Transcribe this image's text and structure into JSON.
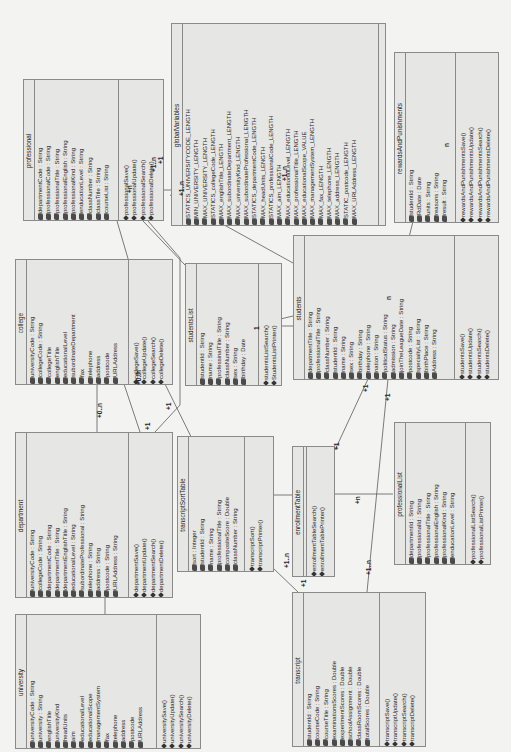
{
  "diagram": {
    "type": "UML class diagram",
    "orientation": "rotated -90deg",
    "colors": {
      "background": "#f3f3f1",
      "box_fill": "#e6e6e4",
      "border": "#8a8a8a",
      "line": "#555555",
      "text": "#222222"
    }
  },
  "classes": {
    "professional": {
      "name": "professional",
      "attributes": [
        "departmentCode : String",
        "professionalCode : String",
        "professionalTitle : String",
        "professionalEnglish : String",
        "professionalKind : String",
        "enducationLevel : String",
        "classNumber : String",
        "classTitle : String",
        "courseList : String"
      ],
      "methods": [
        "professionalSave()",
        "professionalUpdate()",
        "professionalSearch()",
        "professionalDelete()"
      ]
    },
    "globalVariables": {
      "name": "globalVariables",
      "attributes": [
        "STATICS_UNIVERSITYCODE_LENGTH",
        "MIN_UNIVERSITY_LENGTH",
        "MAX_UNIVERSITY_LENGTH",
        "STATICS_collegeCode_LENGTH",
        "MAX_englishTitle_LENGTH",
        "MAX_subordinateDepartment_LENGTH",
        "MAX_universityKind_LENGTH",
        "MAX_subordinateProfessional_LENGTH",
        "STATICS_departmentCode_LENGTH",
        "MAX_headUnits_LENGTH",
        "STATICS_professionalCode_LENGTH",
        "MAX_aim_LENGTH",
        "MAX_educationalLevel_LENGTH",
        "MAX_professionalTitle_LENGTH",
        "MAX_educationalScope_VALUE",
        "MAX_managementSystem_LENGTH",
        "MAX_fax_LENGTH",
        "MAX_telephone_LENGTH",
        "MAX_address_LENGTH",
        "STATIC_postcode_LENGTH",
        "MAX_URLAddress_LENGTH"
      ],
      "methods": []
    },
    "rewardsAndPunishments": {
      "name": "rewardsAndPunishments",
      "attributes": [
        "studentId : String",
        "RdDate : Date",
        "units : String",
        "reasons : String",
        "result : String"
      ],
      "methods": [
        "rewardsAndPunishmentsSave()",
        "rewardsAndPunishmentsUpdate()",
        "rewardsAndPunishmentsSearch()",
        "rewardsAndPunishmentsDelete()"
      ]
    },
    "college": {
      "name": "college",
      "attributes": [
        "universityCode : String",
        "collegeCode : String",
        "collegeTitle",
        "englishTitle",
        "educationalLevel",
        "subordinateDepartment",
        "fax",
        "telephone",
        "address",
        "postcode",
        "URLAddress"
      ],
      "methods": [
        "collegeSave()",
        "collegeUpdate()",
        "collegeSearch()",
        "collegeDelete()"
      ]
    },
    "studentsList": {
      "name": "studentsList",
      "attributes": [
        "studentId : String",
        "name : String",
        "professinalTitle : String",
        "classNumber : String",
        "sex : String",
        "birthday : Date"
      ],
      "methods": [
        "studentsListSearch()",
        "StudentsListPrinter()"
      ]
    },
    "students": {
      "name": "students",
      "attributes": [
        "depatmentTitle : String",
        "professionalTitle : String",
        "classNumber : String",
        "studentId : String",
        "name : String",
        "sex : String",
        "birthday : String",
        "telephone : String",
        "nation : String",
        "politicalStatus : String",
        "admission : String",
        "joinTheLeagueDate : String",
        "postcode : String",
        "specialtyList : String",
        "birthPlace : String",
        "Address : String"
      ],
      "methods": [
        "studentsSave()",
        "studentsUpdate()",
        "studentsSearch()",
        "studentsDelete()"
      ]
    },
    "department": {
      "name": "department",
      "attributes": [
        "universityCode : String",
        "collegeCode : String",
        "departmentCode : String",
        "departmentTitle : String",
        "departmentEnglishTitle : String",
        "educationalLevel : String",
        "subordinateProfessional : String",
        "telephone : String",
        "address : String",
        "postcode : String",
        "URLAddress : String"
      ],
      "methods": [
        "departmentSave()",
        "departmentUpdate()",
        "departmentSearch()",
        "departmentDelete()"
      ]
    },
    "transcriptSortTable": {
      "name": "transcriptSortTable",
      "attributes": [
        "sort : Integer",
        "studentId : String",
        "name : String",
        "professionalTitle : String",
        "compositeScore : Double",
        "classNumber : String"
      ],
      "methods": [
        "transcriptSort()",
        "transcriptPrinter()"
      ]
    },
    "enrollmentTable": {
      "name": "enrollmentTable",
      "attributes": [],
      "methods": [
        "enrollmentTableSearch()",
        "enrollmentTablePrinter()"
      ]
    },
    "professionalList": {
      "name": "professionalList",
      "attributes": [
        "departmentId : String",
        "professionalId : String",
        "professionalTitle : String",
        "professionalEnglish : String",
        "professionalKind : String",
        "enducationLevel : String"
      ],
      "methods": [
        "professionalListSearch()",
        "professionalListPrinter()"
      ]
    },
    "university": {
      "name": "university",
      "attributes": [
        "universityCode : String",
        "university : String",
        "englishTitle",
        "universityKind",
        "headUnits",
        "aim",
        "educationalLevel",
        "educationalScope",
        "managementSystem",
        "fax",
        "telephone",
        "address",
        "postcode",
        "URLAddress"
      ],
      "methods": [
        "universitySave()",
        "universityUpdate()",
        "universitySearch()",
        "universityDelete()"
      ]
    },
    "transcript": {
      "name": "transcript",
      "attributes": [
        "studentId : String",
        "courseCode : String",
        "courseTitle : String",
        "examinationsScores : Double",
        "experimentScores : Double",
        "schoolAssignment : Double",
        "classRoomScores : Double",
        "totalScores : Double"
      ],
      "methods": [
        "transcriptSave()",
        "transcriptUpdate()",
        "transcriptSearch()",
        "transcriptDelete()"
      ]
    }
  },
  "multiplicities": [
    {
      "label": "+1..n",
      "x": 150,
      "y": 172
    },
    {
      "label": "+1",
      "x": 157,
      "y": 164
    },
    {
      "label": "+1..n",
      "x": 178,
      "y": 196
    },
    {
      "label": "+1..n",
      "x": 281,
      "y": 181
    },
    {
      "label": "+n",
      "x": 126,
      "y": 193
    },
    {
      "label": "+0..n",
      "x": 96,
      "y": 418
    },
    {
      "label": "+0..n",
      "x": 135,
      "y": 385
    },
    {
      "label": "+1",
      "x": 165,
      "y": 410
    },
    {
      "label": "+1",
      "x": 144,
      "y": 430
    },
    {
      "label": "+1",
      "x": 362,
      "y": 392
    },
    {
      "label": "+1",
      "x": 384,
      "y": 401
    },
    {
      "label": "+1",
      "x": 333,
      "y": 450
    },
    {
      "label": "+n",
      "x": 354,
      "y": 504
    },
    {
      "label": "+1..n",
      "x": 283,
      "y": 568
    },
    {
      "label": "+1",
      "x": 300,
      "y": 587
    },
    {
      "label": "+1..n",
      "x": 365,
      "y": 575
    },
    {
      "label": "n",
      "x": 443,
      "y": 147
    },
    {
      "label": "n",
      "x": 385,
      "y": 300
    },
    {
      "label": "1",
      "x": 253,
      "y": 330
    },
    {
      "label": "n",
      "x": 134,
      "y": 376
    }
  ]
}
